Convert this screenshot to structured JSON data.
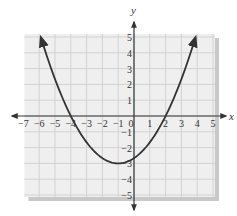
{
  "chart_data": {
    "type": "line",
    "title": "",
    "xlabel": "x",
    "ylabel": "y",
    "xlim": [
      -7,
      5
    ],
    "ylim": [
      -5,
      5
    ],
    "grid": true,
    "x_ticks": [
      -7,
      -6,
      -5,
      -4,
      -3,
      -2,
      -1,
      0,
      1,
      2,
      3,
      4,
      5
    ],
    "y_ticks": [
      -5,
      -4,
      -3,
      -2,
      -1,
      1,
      2,
      3,
      4,
      5
    ],
    "x_tick_labels": [
      "−7",
      "−6",
      "−5",
      "−4",
      "−3",
      "−2",
      "−1",
      "0",
      "1",
      "2",
      "3",
      "4",
      "5"
    ],
    "y_tick_labels": [
      "−5",
      "−4",
      "−3",
      "−2",
      "−1",
      "1",
      "2",
      "3",
      "4",
      "5"
    ],
    "series": [
      {
        "name": "parabola",
        "equation": "y = (1/3)(x + 4)(x − 2)",
        "vertex": [
          -1,
          -3
        ],
        "x_intercepts": [
          -4,
          2
        ],
        "y_intercept": -2.67,
        "arrows_at_ends": true,
        "x": [
          -6,
          -5,
          -4,
          -3,
          -2,
          -1,
          0,
          1,
          2,
          3,
          4
        ],
        "y": [
          5.33,
          2.33,
          0,
          -1.67,
          -2.67,
          -3,
          -2.67,
          -1.67,
          0,
          2.33,
          5.33
        ]
      }
    ],
    "colors": {
      "grid_background": "#efefef",
      "grid_lines": "#d2d2d2",
      "shadow": "#c8c8c8",
      "axes": "#333333",
      "curve": "#333333"
    }
  }
}
